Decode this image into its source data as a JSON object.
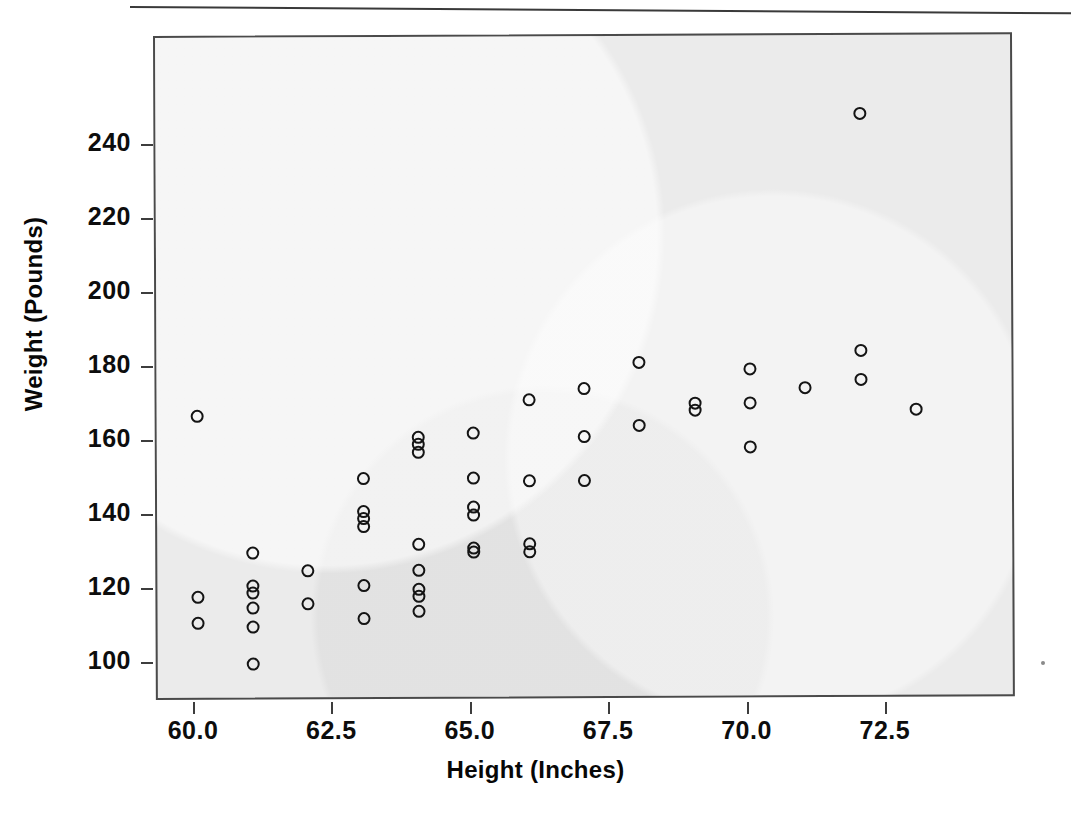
{
  "figure": {
    "background_color": "#ffffff",
    "plot_background_color": "#ebebeb",
    "frame_color": "#4a4a4a",
    "marker_color": "#141414",
    "marker_style": "open-circle"
  },
  "chart_data": {
    "type": "scatter",
    "title": "",
    "xlabel": "Height (Inches)",
    "ylabel": "Weight (Pounds)",
    "xlim": [
      58.8,
      74.3
    ],
    "ylim": [
      94,
      256
    ],
    "grid": false,
    "legend": null,
    "xticks": [
      "60.0",
      "62.5",
      "65.0",
      "67.5",
      "70.0",
      "72.5"
    ],
    "xtick_values": [
      60.0,
      62.5,
      65.0,
      67.5,
      70.0,
      72.5
    ],
    "yticks": [
      "100",
      "120",
      "140",
      "160",
      "180",
      "200",
      "220",
      "240"
    ],
    "ytick_values": [
      100,
      120,
      140,
      160,
      180,
      200,
      220,
      240
    ],
    "series_name": "Height vs Weight",
    "n_points": 46,
    "points": [
      {
        "x": 60,
        "y": 167
      },
      {
        "x": 60,
        "y": 118
      },
      {
        "x": 60,
        "y": 111
      },
      {
        "x": 61,
        "y": 130
      },
      {
        "x": 61,
        "y": 121
      },
      {
        "x": 61,
        "y": 119
      },
      {
        "x": 61,
        "y": 115
      },
      {
        "x": 61,
        "y": 110
      },
      {
        "x": 61,
        "y": 100
      },
      {
        "x": 62,
        "y": 125
      },
      {
        "x": 62,
        "y": 116
      },
      {
        "x": 63,
        "y": 150
      },
      {
        "x": 63,
        "y": 141
      },
      {
        "x": 63,
        "y": 139
      },
      {
        "x": 63,
        "y": 137
      },
      {
        "x": 63,
        "y": 121
      },
      {
        "x": 63,
        "y": 112
      },
      {
        "x": 64,
        "y": 161
      },
      {
        "x": 64,
        "y": 159
      },
      {
        "x": 64,
        "y": 157
      },
      {
        "x": 64,
        "y": 132
      },
      {
        "x": 64,
        "y": 125
      },
      {
        "x": 64,
        "y": 120
      },
      {
        "x": 64,
        "y": 118
      },
      {
        "x": 64,
        "y": 114
      },
      {
        "x": 65,
        "y": 162
      },
      {
        "x": 65,
        "y": 150
      },
      {
        "x": 65,
        "y": 142
      },
      {
        "x": 65,
        "y": 140
      },
      {
        "x": 65,
        "y": 131
      },
      {
        "x": 65,
        "y": 130
      },
      {
        "x": 66,
        "y": 171
      },
      {
        "x": 66,
        "y": 149
      },
      {
        "x": 66,
        "y": 132
      },
      {
        "x": 66,
        "y": 130
      },
      {
        "x": 67,
        "y": 174
      },
      {
        "x": 67,
        "y": 161
      },
      {
        "x": 67,
        "y": 149
      },
      {
        "x": 68,
        "y": 181
      },
      {
        "x": 68,
        "y": 164
      },
      {
        "x": 69,
        "y": 170
      },
      {
        "x": 69,
        "y": 168
      },
      {
        "x": 70,
        "y": 179
      },
      {
        "x": 70,
        "y": 170
      },
      {
        "x": 70,
        "y": 158
      },
      {
        "x": 71,
        "y": 174
      },
      {
        "x": 72,
        "y": 248
      },
      {
        "x": 72,
        "y": 184
      },
      {
        "x": 72,
        "y": 176
      },
      {
        "x": 73,
        "y": 168
      }
    ]
  }
}
